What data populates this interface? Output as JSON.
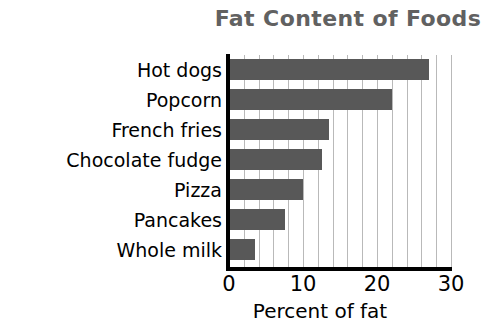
{
  "chart_data": {
    "type": "bar",
    "orientation": "horizontal",
    "title": "Fat Content of Foods",
    "xlabel": "Percent of fat",
    "ylabel": "",
    "categories": [
      "Hot dogs",
      "Popcorn",
      "French fries",
      "Chocolate fudge",
      "Pizza",
      "Pancakes",
      "Whole milk"
    ],
    "values": [
      27,
      22,
      13.5,
      12.5,
      10,
      7.5,
      3.5
    ],
    "xlim": [
      0,
      30
    ],
    "xticks": [
      0,
      10,
      20,
      30
    ],
    "xtick_labels": [
      "0",
      "10",
      "20",
      "30"
    ],
    "minor_tick_interval": 2,
    "grid": true,
    "grid_axis": "x",
    "legend": false,
    "colors": {
      "bar": "#585858",
      "title": "#616161",
      "axis": "#000000",
      "gridline": "#b9b9b9",
      "background": "#ffffff",
      "label": "#000000"
    }
  }
}
